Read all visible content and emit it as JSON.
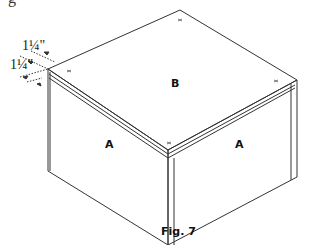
{
  "figure": {
    "cropped_text_top": "g",
    "caption": "Fig. 7",
    "panels": {
      "top": "B",
      "front_left": "A",
      "front_right": "A"
    },
    "dimensions": {
      "upper": "1¼\"",
      "lower": "1¼\""
    },
    "markers": [
      "x",
      "x",
      "x",
      "x"
    ],
    "line_color": "#333333",
    "background": "#ffffff"
  }
}
